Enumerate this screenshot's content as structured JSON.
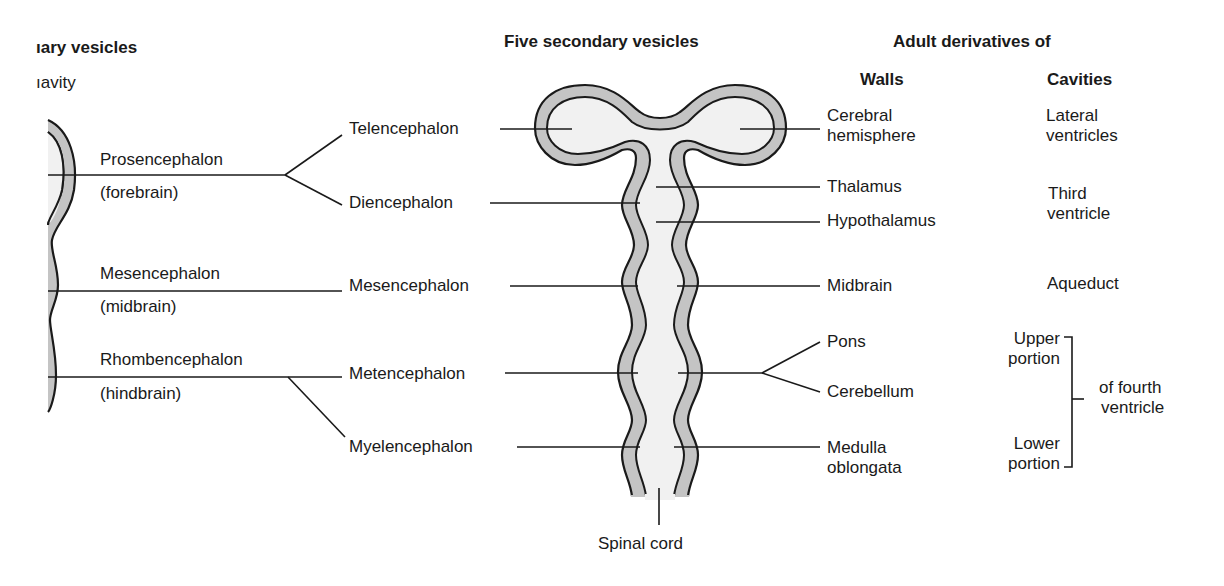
{
  "headers": {
    "primary": "ıary vesicles",
    "primary_sub": "ıavity",
    "secondary": "Five secondary vesicles",
    "adult": "Adult derivatives of",
    "walls": "Walls",
    "cavities": "Cavities"
  },
  "primary_vesicles": [
    {
      "name": "Prosencephalon",
      "common": "(forebrain)"
    },
    {
      "name": "Mesencephalon",
      "common": "(midbrain)"
    },
    {
      "name": "Rhombencephalon",
      "common": "(hindbrain)"
    }
  ],
  "secondary_vesicles": [
    {
      "name": "Telencephalon"
    },
    {
      "name": "Diencephalon"
    },
    {
      "name": "Mesencephalon"
    },
    {
      "name": "Metencephalon"
    },
    {
      "name": "Myelencephalon"
    }
  ],
  "walls": {
    "cerebral_1": "Cerebral",
    "cerebral_2": "hemisphere",
    "thalamus": "Thalamus",
    "hypothalamus": "Hypothalamus",
    "midbrain": "Midbrain",
    "pons": "Pons",
    "cerebellum": "Cerebellum",
    "medulla_1": "Medulla",
    "medulla_2": "oblongata"
  },
  "cavities": {
    "lateral_1": "Lateral",
    "lateral_2": "ventricles",
    "third_1": "Third",
    "third_2": "ventricle",
    "aqueduct": "Aqueduct",
    "upper_1": "Upper",
    "upper_2": "portion",
    "lower_1": "Lower",
    "lower_2": "portion",
    "fourth_1": "of fourth",
    "fourth_2": "ventricle"
  },
  "spinal_cord": "Spinal cord",
  "colors": {
    "wall_fill": "#c4c4c4",
    "cavity_fill": "#f1f1f1",
    "outline": "#1a1a1a"
  }
}
